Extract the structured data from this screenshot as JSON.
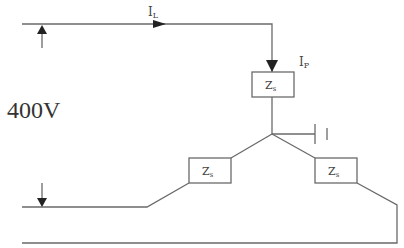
{
  "diagram": {
    "voltage_label": "400V",
    "line_current": {
      "symbol": "I",
      "subscript": "L"
    },
    "phase_current": {
      "symbol": "I",
      "subscript": "P"
    },
    "impedances": [
      {
        "id": "top",
        "symbol": "Z",
        "subscript": "s"
      },
      {
        "id": "left",
        "symbol": "Z",
        "subscript": "s"
      },
      {
        "id": "right",
        "symbol": "Z",
        "subscript": "s"
      }
    ],
    "colors": {
      "wire": "#6a6a6a",
      "arrow": "#222222",
      "text": "#444444"
    }
  }
}
